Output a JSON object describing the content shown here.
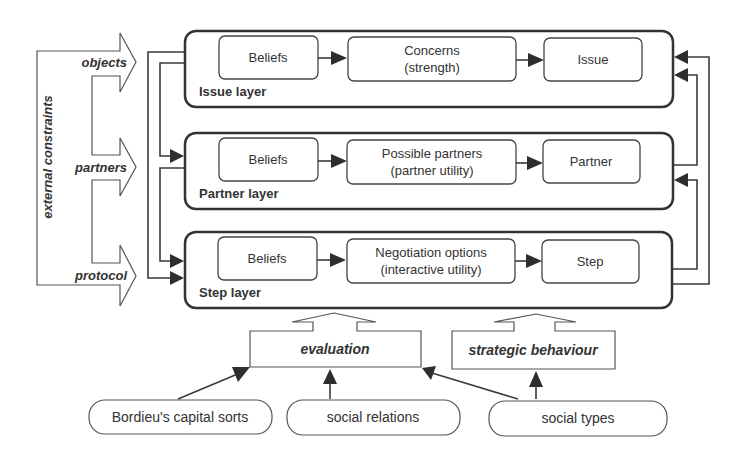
{
  "diagram": {
    "side_label": "external constraints",
    "side_arrows": [
      "objects",
      "partners",
      "protocol"
    ],
    "layers": [
      {
        "name": "Issue layer",
        "beliefs": "Beliefs",
        "middle": [
          "Concerns",
          "(strength)"
        ],
        "output": "Issue"
      },
      {
        "name": "Partner layer",
        "beliefs": "Beliefs",
        "middle": [
          "Possible partners",
          "(partner utility)"
        ],
        "output": "Partner"
      },
      {
        "name": "Step layer",
        "beliefs": "Beliefs",
        "middle": [
          "Negotiation options",
          "(interactive utility)"
        ],
        "output": "Step"
      }
    ],
    "modifiers": [
      "evaluation",
      "strategic behaviour"
    ],
    "sources": [
      "Bordieu's capital sorts",
      "social relations",
      "social types"
    ],
    "colors": {
      "stroke": "#333333",
      "fill": "#ffffff",
      "text": "#333333"
    }
  }
}
